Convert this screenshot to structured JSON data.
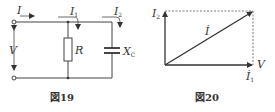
{
  "figure19": {
    "caption": "図19",
    "labels": {
      "I": "I",
      "I1": "I",
      "I1_sub": "1",
      "I2": "I",
      "I2_sub": "2",
      "V": "V",
      "R": "R",
      "Xc": "X",
      "Xc_sub": "C"
    }
  },
  "figure20": {
    "caption": "図20",
    "labels": {
      "I2": "I",
      "I2_sub": "2",
      "I": "İ",
      "I1": "İ",
      "I1_sub": "1",
      "V": "V"
    }
  }
}
